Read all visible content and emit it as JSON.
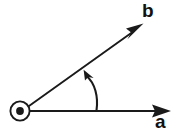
{
  "figure": {
    "kind": "vector-diagram",
    "width": 187,
    "height": 134,
    "background_color": "#ffffff",
    "stroke_color": "#1a1a1a",
    "labels": {
      "vector_a": "a",
      "vector_b": "b"
    },
    "elements": {
      "origin_marker": {
        "name": "origin-circle-with-dot",
        "center_x": 20,
        "center_y": 111,
        "outer_radius": 10,
        "inner_dot_radius": 4,
        "meaning": "pivot point / vector out of page"
      },
      "vector_a": {
        "name": "vector-a-arrow",
        "from_x": 30,
        "from_y": 111,
        "to_x": 171,
        "to_y": 111,
        "label": "a",
        "label_x": 160,
        "label_y": 124,
        "direction_degrees": 0
      },
      "vector_b": {
        "name": "vector-b-arrow",
        "from_x": 28,
        "from_y": 106,
        "to_x": 143,
        "to_y": 24,
        "label": "b",
        "label_x": 148,
        "label_y": 11,
        "direction_degrees": 35
      },
      "rotation_arc": {
        "name": "rotation-arrow",
        "from_x": 97,
        "from_y": 110,
        "to_x": 84,
        "to_y": 70,
        "sweep": "counter-clockwise",
        "meaning": "angle from vector a to vector b"
      }
    }
  }
}
